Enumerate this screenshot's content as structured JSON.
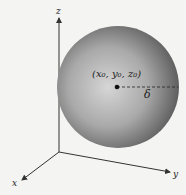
{
  "diagram": {
    "axes": {
      "x": "x",
      "y": "y",
      "z": "z"
    },
    "center_label": "(x₀, y₀, z₀)",
    "radius_label": "δ",
    "colors": {
      "sphere_light": "#d8d8d8",
      "sphere_dark": "#555555",
      "axis": "#333333",
      "background": "#f4f4f2"
    }
  }
}
